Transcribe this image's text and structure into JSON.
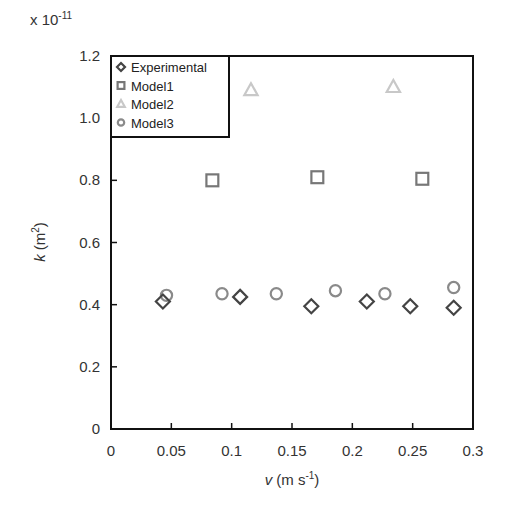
{
  "chart_data": {
    "type": "scatter",
    "title": "",
    "xlabel": "v (m s-1)",
    "xlabel_parts": {
      "var": "v",
      "unit": " (m s",
      "sup": "-1",
      "close": ")"
    },
    "ylabel": "k (m2)",
    "ylabel_parts": {
      "var": "k",
      "unit": " (m",
      "sup": "2",
      "close": ")"
    },
    "y_multiplier": {
      "base": "x 10",
      "exp": "-11"
    },
    "xlim": [
      0,
      0.3
    ],
    "ylim": [
      0,
      1.2
    ],
    "x_ticks": [
      0,
      0.05,
      0.1,
      0.15,
      0.2,
      0.25,
      0.3
    ],
    "x_tick_labels": [
      "0",
      "0.05",
      "0.1",
      "0.15",
      "0.2",
      "0.25",
      "0.3"
    ],
    "y_ticks": [
      0,
      0.2,
      0.4,
      0.6,
      0.8,
      1.0,
      1.2
    ],
    "y_tick_labels": [
      "0",
      "0.2",
      "0.4",
      "0.6",
      "0.8",
      "1.0",
      "1.2"
    ],
    "grid": false,
    "legend_position": "upper left",
    "series": [
      {
        "name": "Experimental",
        "marker": "diamond",
        "color": "#444444",
        "x": [
          0.043,
          0.107,
          0.166,
          0.212,
          0.248,
          0.284
        ],
        "y": [
          0.41,
          0.425,
          0.395,
          0.41,
          0.395,
          0.39
        ]
      },
      {
        "name": "Model1",
        "marker": "square",
        "color": "#777777",
        "x": [
          0.084,
          0.171,
          0.258
        ],
        "y": [
          0.8,
          0.81,
          0.805
        ]
      },
      {
        "name": "Model2",
        "marker": "triangle",
        "color": "#c8c8c8",
        "x": [
          0.116,
          0.234
        ],
        "y": [
          1.09,
          1.1
        ]
      },
      {
        "name": "Model3",
        "marker": "circle",
        "color": "#8a8a8a",
        "x": [
          0.046,
          0.092,
          0.137,
          0.186,
          0.227,
          0.284
        ],
        "y": [
          0.43,
          0.435,
          0.435,
          0.445,
          0.435,
          0.455
        ]
      }
    ]
  }
}
